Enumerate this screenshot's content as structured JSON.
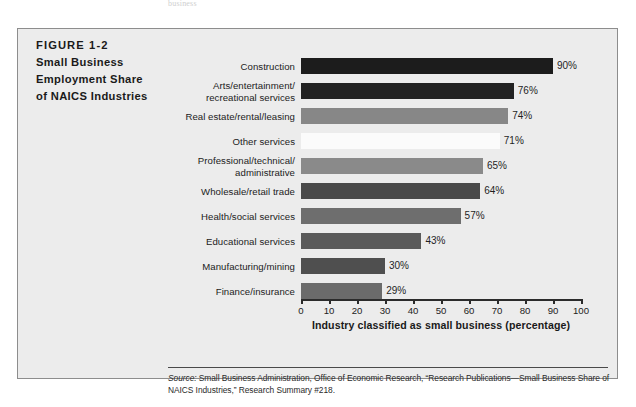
{
  "page": {
    "top_cut_text": "business"
  },
  "figure": {
    "number": "FIGURE 1-2",
    "title_line1": "Small Business",
    "title_line2": "Employment Share",
    "title_line3": "of NAICS Industries"
  },
  "source": {
    "label": "Source:",
    "text": " Small Business Administration, Office of Economic Research, “Research Publications—Small Business Share of NAICS Industries,” Research Summary #218."
  },
  "chart_data": {
    "type": "bar",
    "orientation": "horizontal",
    "title": "Small Business Employment Share of NAICS Industries",
    "xlabel": "Industry classified as small business (percentage)",
    "ylabel": "",
    "xlim": [
      0,
      100
    ],
    "grid": false,
    "legend": "none",
    "tick_labels": [
      "0",
      "10",
      "20",
      "30",
      "40",
      "50",
      "60",
      "70",
      "80",
      "90",
      "100"
    ],
    "ticks": [
      0,
      10,
      20,
      30,
      40,
      50,
      60,
      70,
      80,
      90,
      100
    ],
    "categories": [
      "Construction",
      "Arts/entertainment/ recreational services",
      "Real estate/rental/leasing",
      "Other services",
      "Professional/technical/ administrative",
      "Wholesale/retail trade",
      "Health/social services",
      "Educational services",
      "Manufacturing/mining",
      "Finance/insurance"
    ],
    "values": [
      90,
      76,
      74,
      71,
      65,
      64,
      57,
      43,
      30,
      29
    ],
    "value_labels": [
      "90%",
      "76%",
      "74%",
      "71%",
      "65%",
      "64%",
      "57%",
      "43%",
      "30%",
      "29%"
    ],
    "bar_colors": [
      "#1c1c1c",
      "#222222",
      "#878787",
      "#fbfbfb",
      "#8a8a8a",
      "#4a4a4a",
      "#6e6e6e",
      "#5a5a5a",
      "#4f4f4f",
      "#6b6b6b"
    ],
    "bars": [
      {
        "label_line1": "Construction",
        "label_line2": "",
        "value": 90,
        "value_label": "90%",
        "color": "#1c1c1c"
      },
      {
        "label_line1": "Arts/entertainment/",
        "label_line2": "recreational services",
        "value": 76,
        "value_label": "76%",
        "color": "#222222"
      },
      {
        "label_line1": "Real estate/rental/leasing",
        "label_line2": "",
        "value": 74,
        "value_label": "74%",
        "color": "#878787"
      },
      {
        "label_line1": "Other services",
        "label_line2": "",
        "value": 71,
        "value_label": "71%",
        "color": "#fbfbfb"
      },
      {
        "label_line1": "Professional/technical/",
        "label_line2": "administrative",
        "value": 65,
        "value_label": "65%",
        "color": "#8a8a8a"
      },
      {
        "label_line1": "Wholesale/retail trade",
        "label_line2": "",
        "value": 64,
        "value_label": "64%",
        "color": "#4a4a4a"
      },
      {
        "label_line1": "Health/social services",
        "label_line2": "",
        "value": 57,
        "value_label": "57%",
        "color": "#6e6e6e"
      },
      {
        "label_line1": "Educational services",
        "label_line2": "",
        "value": 43,
        "value_label": "43%",
        "color": "#5a5a5a"
      },
      {
        "label_line1": "Manufacturing/mining",
        "label_line2": "",
        "value": 30,
        "value_label": "30%",
        "color": "#4f4f4f"
      },
      {
        "label_line1": "Finance/insurance",
        "label_line2": "",
        "value": 29,
        "value_label": "29%",
        "color": "#6b6b6b"
      }
    ]
  },
  "style": {
    "panel_bg": "#ececec",
    "panel_border": "#8d8d8d",
    "axis_color": "#2b2b2b"
  }
}
